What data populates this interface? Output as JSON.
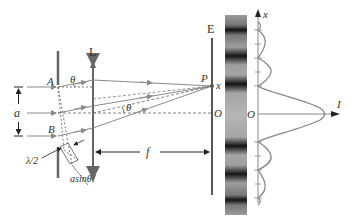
{
  "diagram": {
    "type": "single-slit Fraunhofer diffraction",
    "labels": {
      "lens": "L",
      "screen": "E",
      "slit_top": "A",
      "slit_bottom": "B",
      "slit_width": "a",
      "angle": "θ",
      "angle_lower": "θ",
      "point_p": "P",
      "point_x": "x",
      "origin_screen": "O",
      "origin_plot": "O",
      "focal_length": "f",
      "half_wavelength": "λ/2",
      "path_difference": "asinθ",
      "plot_x_axis": "x",
      "plot_i_axis": "I"
    },
    "colors": {
      "ray": "#8a8a8a",
      "solid": "#666666",
      "dark_fringe": "#111111",
      "light_fringe": "#9a9a9a",
      "text": "#333333"
    },
    "fringes": {
      "dark_bands_y": [
        30,
        58,
        86,
        142,
        170,
        198
      ],
      "central_bright_y": 114
    },
    "intensity_plot": {
      "ticks_y": [
        30,
        44,
        58,
        72,
        86,
        142,
        156,
        170,
        184,
        198
      ],
      "central_peak": "I max at O"
    }
  }
}
